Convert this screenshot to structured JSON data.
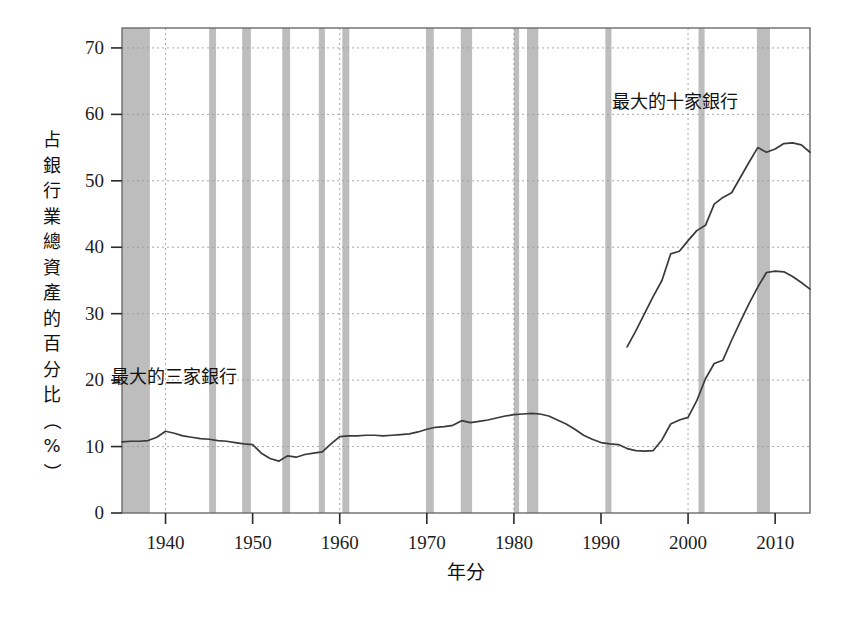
{
  "chart_data": {
    "type": "line",
    "title": "",
    "xlabel": "年分",
    "ylabel": "占銀行業總資產的百分比（%）",
    "ylabel_chars": [
      "占",
      "銀",
      "行",
      "業",
      "總",
      "資",
      "產",
      "的",
      "百",
      "分",
      "比",
      "（",
      "%",
      "）"
    ],
    "xlim": [
      1935,
      2014
    ],
    "ylim": [
      0,
      73
    ],
    "yticks": [
      0,
      10,
      20,
      30,
      40,
      50,
      60,
      70
    ],
    "ytick_labels": [
      "0",
      "10",
      "20",
      "30",
      "40",
      "50",
      "60",
      "70"
    ],
    "xticks": [
      1940,
      1950,
      1960,
      1970,
      1980,
      1990,
      2000,
      2010
    ],
    "xtick_labels": [
      "1940",
      "1950",
      "1960",
      "1970",
      "1980",
      "1990",
      "2000",
      "2010"
    ],
    "grid": "dotted",
    "legend_position": "inline-annotations",
    "line_color": "#3a3a3a",
    "recession_band_color": "#bdbdbd",
    "grid_color": "#9a9a9a",
    "frame_color": "#6b6b6b",
    "annotations": [
      {
        "text": "最大的十家銀行",
        "x": 1998.5,
        "y": 61.0,
        "name": "ten-largest-banks-label"
      },
      {
        "text": "最大的三家銀行",
        "x": 1941.0,
        "y": 19.5,
        "name": "three-largest-banks-label"
      }
    ],
    "recessions": [
      {
        "start": 1935.0,
        "end": 1938.2
      },
      {
        "start": 1945.0,
        "end": 1945.8
      },
      {
        "start": 1948.8,
        "end": 1949.8
      },
      {
        "start": 1953.4,
        "end": 1954.3
      },
      {
        "start": 1957.6,
        "end": 1958.3
      },
      {
        "start": 1960.3,
        "end": 1961.1
      },
      {
        "start": 1969.9,
        "end": 1970.8
      },
      {
        "start": 1973.9,
        "end": 1975.2
      },
      {
        "start": 1980.0,
        "end": 1980.6
      },
      {
        "start": 1981.5,
        "end": 1982.8
      },
      {
        "start": 1990.5,
        "end": 1991.2
      },
      {
        "start": 2001.2,
        "end": 2001.9
      },
      {
        "start": 2007.9,
        "end": 2009.4
      }
    ],
    "series": [
      {
        "name": "最大的三家銀行",
        "label": "最大的三家銀行",
        "x": [
          1935,
          1936,
          1937,
          1938,
          1939,
          1940,
          1941,
          1942,
          1943,
          1944,
          1945,
          1946,
          1947,
          1948,
          1949,
          1950,
          1951,
          1952,
          1953,
          1954,
          1955,
          1956,
          1957,
          1958,
          1959,
          1960,
          1961,
          1962,
          1963,
          1964,
          1965,
          1966,
          1967,
          1968,
          1969,
          1970,
          1971,
          1972,
          1973,
          1974,
          1975,
          1976,
          1977,
          1978,
          1979,
          1980,
          1981,
          1982,
          1983,
          1984,
          1985,
          1986,
          1987,
          1988,
          1989,
          1990,
          1991,
          1992,
          1993,
          1994,
          1995,
          1996,
          1997,
          1998,
          1999,
          2000,
          2001,
          2002,
          2003,
          2004,
          2005,
          2006,
          2007,
          2008,
          2009,
          2010,
          2011,
          2012,
          2013,
          2014
        ],
        "values": [
          10.7,
          10.8,
          10.8,
          10.9,
          11.4,
          12.3,
          12.0,
          11.6,
          11.4,
          11.2,
          11.1,
          10.9,
          10.8,
          10.6,
          10.4,
          10.3,
          9.0,
          8.2,
          7.8,
          8.6,
          8.4,
          8.8,
          9.0,
          9.2,
          10.4,
          11.5,
          11.6,
          11.6,
          11.7,
          11.7,
          11.6,
          11.7,
          11.8,
          11.9,
          12.2,
          12.6,
          12.9,
          13.0,
          13.2,
          13.9,
          13.6,
          13.8,
          14.0,
          14.3,
          14.6,
          14.8,
          14.9,
          15.0,
          14.9,
          14.6,
          14.0,
          13.4,
          12.6,
          11.7,
          11.1,
          10.6,
          10.4,
          10.3,
          9.7,
          9.4,
          9.3,
          9.4,
          11.0,
          13.4,
          14.0,
          14.4,
          16.9,
          20.2,
          22.5,
          23.0,
          26.0,
          28.8,
          31.5,
          34.0,
          36.2,
          36.4,
          36.3,
          35.6,
          34.7,
          33.7
        ]
      },
      {
        "name": "最大的十家銀行",
        "label": "最大的十家銀行",
        "x": [
          1993,
          1994,
          1995,
          1996,
          1997,
          1998,
          1999,
          2000,
          2001,
          2002,
          2003,
          2004,
          2005,
          2006,
          2007,
          2008,
          2009,
          2010,
          2011,
          2012,
          2013,
          2014
        ],
        "values": [
          25.0,
          27.4,
          30.0,
          32.6,
          35.0,
          39.0,
          39.4,
          41.0,
          42.5,
          43.3,
          46.5,
          47.5,
          48.2,
          50.5,
          52.8,
          55.0,
          54.3,
          54.8,
          55.6,
          55.7,
          55.4,
          54.3
        ]
      }
    ]
  }
}
